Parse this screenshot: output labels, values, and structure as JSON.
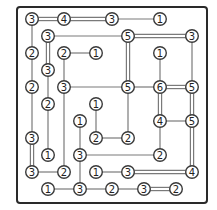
{
  "puzzle": {
    "type": "Hashiwokakero (Bridges)",
    "grid": {
      "cols": 11,
      "rows": 11,
      "origin_x": 32,
      "origin_y": 19,
      "step_x": 16,
      "step_y": 17
    },
    "frame": {
      "x": 17,
      "y": 7,
      "width": 190,
      "height": 196
    },
    "islands": [
      {
        "c": 0,
        "r": 0,
        "v": 3
      },
      {
        "c": 2,
        "r": 0,
        "v": 4
      },
      {
        "c": 5,
        "r": 0,
        "v": 3
      },
      {
        "c": 8,
        "r": 0,
        "v": 1
      },
      {
        "c": 1,
        "r": 1,
        "v": 3
      },
      {
        "c": 6,
        "r": 1,
        "v": 5
      },
      {
        "c": 10,
        "r": 1,
        "v": 3
      },
      {
        "c": 0,
        "r": 2,
        "v": 2
      },
      {
        "c": 2,
        "r": 2,
        "v": 2
      },
      {
        "c": 4,
        "r": 2,
        "v": 1
      },
      {
        "c": 8,
        "r": 2,
        "v": 1
      },
      {
        "c": 1,
        "r": 3,
        "v": 3
      },
      {
        "c": 0,
        "r": 4,
        "v": 2
      },
      {
        "c": 2,
        "r": 4,
        "v": 3
      },
      {
        "c": 6,
        "r": 4,
        "v": 5
      },
      {
        "c": 8,
        "r": 4,
        "v": 6
      },
      {
        "c": 10,
        "r": 4,
        "v": 5
      },
      {
        "c": 1,
        "r": 5,
        "v": 2
      },
      {
        "c": 4,
        "r": 5,
        "v": 1
      },
      {
        "c": 3,
        "r": 6,
        "v": 1
      },
      {
        "c": 8,
        "r": 6,
        "v": 4
      },
      {
        "c": 10,
        "r": 6,
        "v": 5
      },
      {
        "c": 0,
        "r": 7,
        "v": 3
      },
      {
        "c": 4,
        "r": 7,
        "v": 2
      },
      {
        "c": 6,
        "r": 7,
        "v": 2
      },
      {
        "c": 1,
        "r": 8,
        "v": 1
      },
      {
        "c": 3,
        "r": 8,
        "v": 3
      },
      {
        "c": 8,
        "r": 8,
        "v": 2
      },
      {
        "c": 0,
        "r": 9,
        "v": 3
      },
      {
        "c": 2,
        "r": 9,
        "v": 2
      },
      {
        "c": 4,
        "r": 9,
        "v": 1
      },
      {
        "c": 6,
        "r": 9,
        "v": 3
      },
      {
        "c": 10,
        "r": 9,
        "v": 4
      },
      {
        "c": 1,
        "r": 10,
        "v": 1
      },
      {
        "c": 3,
        "r": 10,
        "v": 3
      },
      {
        "c": 5,
        "r": 10,
        "v": 2
      },
      {
        "c": 7,
        "r": 10,
        "v": 3
      },
      {
        "c": 9,
        "r": 10,
        "v": 2
      }
    ],
    "bridges": [
      {
        "a": [
          0,
          0
        ],
        "b": [
          2,
          0
        ],
        "n": 2
      },
      {
        "a": [
          2,
          0
        ],
        "b": [
          5,
          0
        ],
        "n": 2
      },
      {
        "a": [
          5,
          0
        ],
        "b": [
          8,
          0
        ],
        "n": 1
      },
      {
        "a": [
          0,
          0
        ],
        "b": [
          0,
          2
        ],
        "n": 1
      },
      {
        "a": [
          1,
          1
        ],
        "b": [
          6,
          1
        ],
        "n": 1
      },
      {
        "a": [
          6,
          1
        ],
        "b": [
          10,
          1
        ],
        "n": 2
      },
      {
        "a": [
          1,
          1
        ],
        "b": [
          1,
          3
        ],
        "n": 2
      },
      {
        "a": [
          6,
          1
        ],
        "b": [
          6,
          4
        ],
        "n": 2
      },
      {
        "a": [
          10,
          1
        ],
        "b": [
          10,
          4
        ],
        "n": 1
      },
      {
        "a": [
          0,
          2
        ],
        "b": [
          0,
          4
        ],
        "n": 1
      },
      {
        "a": [
          2,
          2
        ],
        "b": [
          4,
          2
        ],
        "n": 1
      },
      {
        "a": [
          2,
          2
        ],
        "b": [
          2,
          4
        ],
        "n": 1
      },
      {
        "a": [
          8,
          2
        ],
        "b": [
          8,
          4
        ],
        "n": 1
      },
      {
        "a": [
          1,
          3
        ],
        "b": [
          1,
          5
        ],
        "n": 1
      },
      {
        "a": [
          2,
          4
        ],
        "b": [
          6,
          4
        ],
        "n": 1
      },
      {
        "a": [
          6,
          4
        ],
        "b": [
          8,
          4
        ],
        "n": 1
      },
      {
        "a": [
          8,
          4
        ],
        "b": [
          10,
          4
        ],
        "n": 2
      },
      {
        "a": [
          0,
          4
        ],
        "b": [
          0,
          7
        ],
        "n": 1
      },
      {
        "a": [
          2,
          4
        ],
        "b": [
          2,
          9
        ],
        "n": 1
      },
      {
        "a": [
          6,
          4
        ],
        "b": [
          6,
          7
        ],
        "n": 1
      },
      {
        "a": [
          8,
          4
        ],
        "b": [
          8,
          6
        ],
        "n": 2
      },
      {
        "a": [
          10,
          4
        ],
        "b": [
          10,
          6
        ],
        "n": 2
      },
      {
        "a": [
          1,
          5
        ],
        "b": [
          1,
          8
        ],
        "n": 1
      },
      {
        "a": [
          4,
          5
        ],
        "b": [
          4,
          7
        ],
        "n": 1
      },
      {
        "a": [
          3,
          6
        ],
        "b": [
          3,
          8
        ],
        "n": 1
      },
      {
        "a": [
          8,
          6
        ],
        "b": [
          10,
          6
        ],
        "n": 1
      },
      {
        "a": [
          8,
          6
        ],
        "b": [
          8,
          8
        ],
        "n": 1
      },
      {
        "a": [
          10,
          6
        ],
        "b": [
          10,
          9
        ],
        "n": 2
      },
      {
        "a": [
          4,
          7
        ],
        "b": [
          6,
          7
        ],
        "n": 1
      },
      {
        "a": [
          0,
          7
        ],
        "b": [
          0,
          9
        ],
        "n": 2
      },
      {
        "a": [
          3,
          8
        ],
        "b": [
          8,
          8
        ],
        "n": 1
      },
      {
        "a": [
          3,
          8
        ],
        "b": [
          3,
          10
        ],
        "n": 1
      },
      {
        "a": [
          0,
          9
        ],
        "b": [
          2,
          9
        ],
        "n": 1
      },
      {
        "a": [
          4,
          9
        ],
        "b": [
          6,
          9
        ],
        "n": 1
      },
      {
        "a": [
          6,
          9
        ],
        "b": [
          10,
          9
        ],
        "n": 2
      },
      {
        "a": [
          1,
          10
        ],
        "b": [
          3,
          10
        ],
        "n": 1
      },
      {
        "a": [
          3,
          10
        ],
        "b": [
          5,
          10
        ],
        "n": 1
      },
      {
        "a": [
          5,
          10
        ],
        "b": [
          7,
          10
        ],
        "n": 1
      },
      {
        "a": [
          7,
          10
        ],
        "b": [
          9,
          10
        ],
        "n": 2
      }
    ]
  }
}
